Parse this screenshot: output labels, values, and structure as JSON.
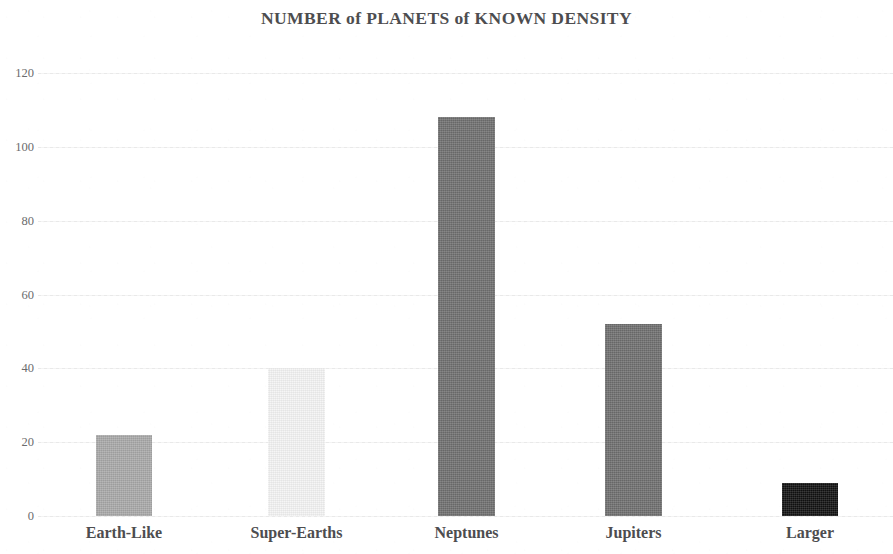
{
  "chart_data": {
    "type": "bar",
    "title": "NUMBER of PLANETS of KNOWN DENSITY",
    "xlabel": "",
    "ylabel": "",
    "categories": [
      "Earth-Like",
      "Super-Earths",
      "Neptunes",
      "Jupiters",
      "Larger"
    ],
    "values": [
      22,
      40,
      108,
      52,
      9
    ],
    "series": [
      {
        "name": "Number of planets",
        "values": [
          22,
          40,
          108,
          52,
          9
        ]
      }
    ],
    "bar_colors": [
      "#a8a8a8",
      "#f4f4f4",
      "#6e6e6e",
      "#6e6e6e",
      "#111111"
    ],
    "ylim": [
      0,
      120
    ],
    "ytick_labels": [
      "0",
      "20",
      "40",
      "60",
      "80",
      "100",
      "120"
    ],
    "ytick_values": [
      0,
      20,
      40,
      60,
      80,
      100,
      120
    ],
    "grid": true,
    "grid_axis": "y",
    "legend": false,
    "legend_position": "none"
  },
  "style": {
    "title_color": "#4d4d4f",
    "tick_color": "#6b6b6d",
    "category_label_color": "#4d4d4f",
    "gridline_color": "#ededed",
    "background": "#ffffff"
  }
}
